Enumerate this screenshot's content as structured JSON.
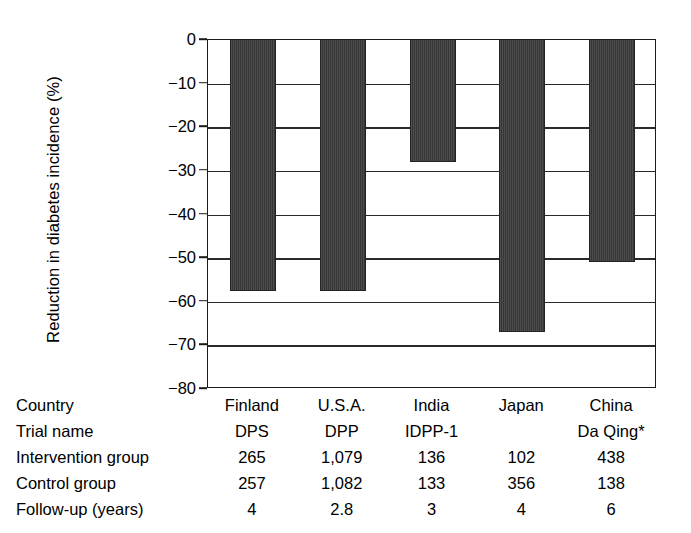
{
  "chart_data": {
    "type": "bar",
    "title": "",
    "xlabel": "",
    "ylabel": "Reduction in diabetes incidence (%)",
    "categories": [
      "Finland",
      "U.S.A.",
      "India",
      "Japan",
      "China"
    ],
    "values": [
      -57.5,
      -57.5,
      -28,
      -67,
      -51
    ],
    "ylim": [
      -80,
      0
    ],
    "yticks": [
      0,
      -10,
      -20,
      -30,
      -40,
      -50,
      -60,
      -70,
      -80
    ],
    "ytick_labels": [
      "0",
      "−10",
      "−20",
      "−30",
      "−40",
      "−50",
      "−60",
      "−70",
      "−80"
    ],
    "grid": true,
    "legend": "none",
    "bar_color": "#3c3c3c",
    "axis_color": "#1a1a1a"
  },
  "table": {
    "rows": [
      {
        "label": "Country",
        "values": [
          "Finland",
          "U.S.A.",
          "India",
          "Japan",
          "China"
        ]
      },
      {
        "label": "Trial name",
        "values": [
          "DPS",
          "DPP",
          "IDPP-1",
          "",
          "Da Qing*"
        ]
      },
      {
        "label": "Intervention group",
        "values": [
          "265",
          "1,079",
          "136",
          "102",
          "438"
        ]
      },
      {
        "label": "Control group",
        "values": [
          "257",
          "1,082",
          "133",
          "356",
          "138"
        ]
      },
      {
        "label": "Follow-up (years)",
        "values": [
          "4",
          "2.8",
          "3",
          "4",
          "6"
        ]
      }
    ]
  }
}
